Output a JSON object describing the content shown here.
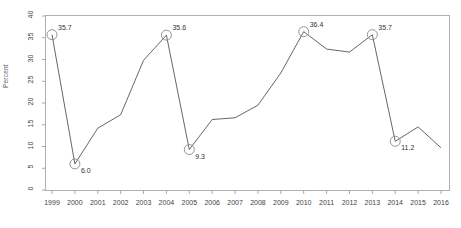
{
  "chart_data": {
    "type": "line",
    "title": "",
    "subtitle": "",
    "xlabel": "",
    "ylabel": "Percent",
    "xlim": [
      1999,
      2016
    ],
    "ylim": [
      0,
      40
    ],
    "grid": false,
    "legend": null,
    "x": [
      1999,
      2000,
      2001,
      2002,
      2003,
      2004,
      2005,
      2006,
      2007,
      2008,
      2009,
      2010,
      2011,
      2012,
      2013,
      2014,
      2015,
      2016
    ],
    "values": [
      35.7,
      6.0,
      14.2,
      17.3,
      29.8,
      35.6,
      9.3,
      16.2,
      16.6,
      19.5,
      26.9,
      36.4,
      32.4,
      31.7,
      35.7,
      11.2,
      14.5,
      9.7
    ],
    "ytick_labels": [
      "0",
      "5",
      "10",
      "15",
      "20",
      "25",
      "30",
      "35",
      "40"
    ],
    "ytick_values": [
      0,
      5,
      10,
      15,
      20,
      25,
      30,
      35,
      40
    ],
    "xtick_labels": [
      "1999",
      "2000",
      "2001",
      "2002",
      "2003",
      "2004",
      "2005",
      "2006",
      "2007",
      "2008",
      "2009",
      "2010",
      "2011",
      "2012",
      "2013",
      "2014",
      "2015",
      "2016"
    ],
    "annotations": [
      {
        "x": 1999,
        "y": 35.7,
        "label": "35.7",
        "marker": "circle",
        "label_pos": "upper-right"
      },
      {
        "x": 2000,
        "y": 6.0,
        "label": "6.0",
        "marker": "circle",
        "label_pos": "lower-right"
      },
      {
        "x": 2004,
        "y": 35.6,
        "label": "35.6",
        "marker": "circle",
        "label_pos": "upper-right"
      },
      {
        "x": 2005,
        "y": 9.3,
        "label": "9.3",
        "marker": "circle",
        "label_pos": "lower-right"
      },
      {
        "x": 2010,
        "y": 36.4,
        "label": "36.4",
        "marker": "circle",
        "label_pos": "upper-right"
      },
      {
        "x": 2013,
        "y": 35.7,
        "label": "35.7",
        "marker": "circle",
        "label_pos": "upper-right"
      },
      {
        "x": 2014,
        "y": 11.2,
        "label": "11.2",
        "marker": "circle",
        "label_pos": "lower-right"
      }
    ],
    "colors": {
      "line": "#555555",
      "marker_stroke": "#888888",
      "marker_fill": "none",
      "axis": "#aaaaaa",
      "text": "#444444",
      "background": "#ffffff"
    }
  }
}
